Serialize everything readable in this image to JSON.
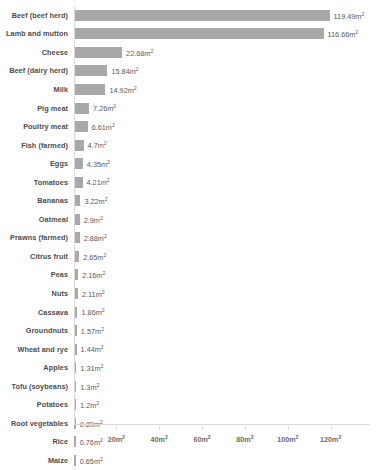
{
  "chart_data": {
    "type": "bar",
    "orientation": "horizontal",
    "title": "",
    "subtitle": "",
    "xlabel": "",
    "ylabel": "",
    "unit": "m²",
    "xlim": [
      0,
      126
    ],
    "grid": false,
    "legend": null,
    "bar_color": "#a9a9a9",
    "label_color": "#4d4d4d",
    "value_color": "#5a5a5a",
    "axis_color": "#d9d9d9",
    "axis_ticks": [
      {
        "value": 20,
        "label": "20m²"
      },
      {
        "value": 40,
        "label": "40m²"
      },
      {
        "value": 60,
        "label": "60m²"
      },
      {
        "value": 80,
        "label": "80m²"
      },
      {
        "value": 100,
        "label": "100m²"
      },
      {
        "value": 120,
        "label": "120m²"
      }
    ],
    "categories": [
      "Beef (beef herd)",
      "Lamb and mutton",
      "Cheese",
      "Beef (dairy herd)",
      "Milk",
      "Pig meat",
      "Poultry meat",
      "Fish (farmed)",
      "Eggs",
      "Tomatoes",
      "Bananas",
      "Oatmeal",
      "Prawns (farmed)",
      "Citrus fruit",
      "Peas",
      "Nuts",
      "Cassava",
      "Groundnuts",
      "Wheat and rye",
      "Apples",
      "Tofu (soybeans)",
      "Potatoes",
      "Root vegetables",
      "Rice",
      "Maize"
    ],
    "values": [
      119.49,
      116.66,
      22.68,
      15.84,
      14.92,
      7.26,
      6.61,
      4.7,
      4.35,
      4.21,
      3.22,
      2.9,
      2.88,
      2.65,
      2.16,
      2.11,
      1.86,
      1.57,
      1.44,
      1.31,
      1.3,
      1.2,
      0.89,
      0.76,
      0.65
    ],
    "value_labels": [
      "119.49m²",
      "116.66m²",
      "22.68m²",
      "15.84m²",
      "14.92m²",
      "7.26m²",
      "6.61m²",
      "4.7m²",
      "4.35m²",
      "4.21m²",
      "3.22m²",
      "2.9m²",
      "2.88m²",
      "2.65m²",
      "2.16m²",
      "2.11m²",
      "1.86m²",
      "1.57m²",
      "1.44m²",
      "1.31m²",
      "1.3m²",
      "1.2m²",
      "0.89m²",
      "0.76m²",
      "0.65m²"
    ]
  }
}
